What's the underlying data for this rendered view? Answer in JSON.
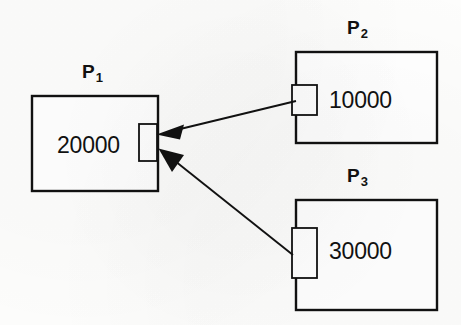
{
  "diagram": {
    "type": "node-link",
    "background_color": "#fdfdfc",
    "stroke_color": "#111111",
    "nodes": [
      {
        "id": "P1",
        "label_text": "P",
        "label_sub": "1",
        "value": "20000",
        "box": {
          "x": 32,
          "y": 96,
          "width": 126,
          "height": 95
        },
        "label_pos": {
          "x": 82,
          "y": 62
        },
        "value_pos": {
          "x": 57,
          "y": 134
        },
        "port": {
          "x": 139,
          "y": 124,
          "width": 18,
          "height": 37,
          "side": "right"
        }
      },
      {
        "id": "P2",
        "label_text": "P",
        "label_sub": "2",
        "value": "10000",
        "box": {
          "x": 296,
          "y": 52,
          "width": 141,
          "height": 91
        },
        "label_pos": {
          "x": 347,
          "y": 18
        },
        "value_pos": {
          "x": 329,
          "y": 89
        },
        "port": {
          "x": 292,
          "y": 85,
          "width": 25,
          "height": 30,
          "side": "left"
        }
      },
      {
        "id": "P3",
        "label_text": "P",
        "label_sub": "3",
        "value": "30000",
        "box": {
          "x": 296,
          "y": 200,
          "width": 141,
          "height": 110
        },
        "label_pos": {
          "x": 347,
          "y": 166
        },
        "value_pos": {
          "x": 329,
          "y": 240
        },
        "port": {
          "x": 292,
          "y": 228,
          "width": 25,
          "height": 50,
          "side": "left"
        }
      }
    ],
    "edges": [
      {
        "id": "edge-p2-to-p1",
        "from": "P2",
        "to": "P1",
        "from_point": {
          "x": 296,
          "y": 101
        },
        "to_point": {
          "x": 157,
          "y": 134
        },
        "arrowhead": "filled-triangle",
        "direction": "P2 to P1"
      },
      {
        "id": "edge-p3-to-p1",
        "from": "P3",
        "to": "P1",
        "from_point": {
          "x": 293,
          "y": 255
        },
        "to_point": {
          "x": 159,
          "y": 149
        },
        "arrowhead": "filled-triangle",
        "direction": "P3 to P1"
      }
    ]
  }
}
